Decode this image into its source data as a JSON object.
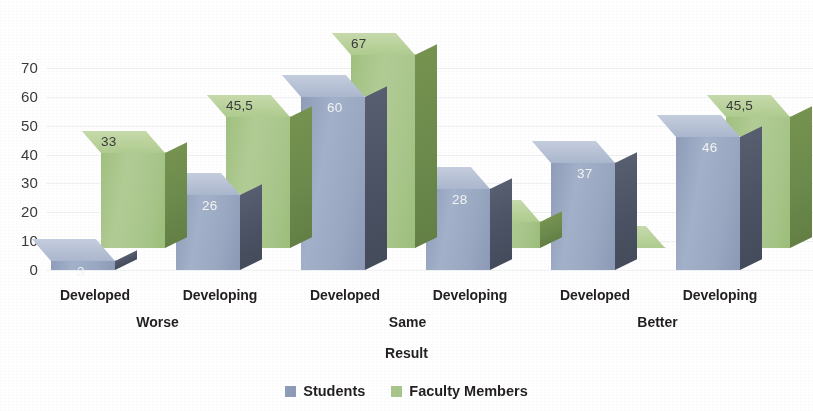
{
  "chart_data": {
    "type": "bar",
    "title": "",
    "subtitle": "",
    "xlabel": "Result",
    "ylabel": "",
    "ylim": [
      0,
      70
    ],
    "yticks": [
      0,
      10,
      20,
      30,
      40,
      50,
      60,
      70
    ],
    "ytick_labels": [
      "0",
      "10",
      "20",
      "30",
      "40",
      "50",
      "60",
      "70"
    ],
    "grid": true,
    "legend_position": "bottom",
    "categories": [
      "Developed",
      "Developing",
      "Developed",
      "Developing",
      "Developed",
      "Developing"
    ],
    "group_labels": [
      "Worse",
      "Same",
      "Better"
    ],
    "series": [
      {
        "name": "Students",
        "color": "#9aa9c4",
        "values": [
          3,
          26,
          60,
          28,
          37,
          46
        ],
        "value_labels": [
          "3",
          "26",
          "60",
          "28",
          "37",
          "46"
        ]
      },
      {
        "name": "Faculty Members",
        "color": "#a9c98a",
        "values": [
          33,
          45.5,
          67,
          9,
          0,
          45.5
        ],
        "value_labels": [
          "33",
          "45,5",
          "67",
          "9",
          "0",
          "45,5"
        ]
      }
    ]
  },
  "axis": {
    "y_ticks": [
      {
        "label": "70"
      },
      {
        "label": "60"
      },
      {
        "label": "50"
      },
      {
        "label": "40"
      },
      {
        "label": "30"
      },
      {
        "label": "20"
      },
      {
        "label": "10"
      },
      {
        "label": "0"
      }
    ],
    "x_ticks": [
      {
        "label": "Developed"
      },
      {
        "label": "Developing"
      },
      {
        "label": "Developed"
      },
      {
        "label": "Developing"
      },
      {
        "label": "Developed"
      },
      {
        "label": "Developing"
      }
    ],
    "x_groups": [
      {
        "label": "Worse"
      },
      {
        "label": "Same"
      },
      {
        "label": "Better"
      }
    ],
    "title": "Result"
  },
  "legend": {
    "items": [
      {
        "label": "Students",
        "color": "#8e9cb8"
      },
      {
        "label": "Faculty Members",
        "color": "#a8c68b"
      }
    ]
  },
  "bars": [
    {
      "label": "3",
      "series": "Students",
      "group": "Worse",
      "category": "Developed"
    },
    {
      "label": "33",
      "series": "Faculty Members",
      "group": "Worse",
      "category": "Developed"
    },
    {
      "label": "26",
      "series": "Students",
      "group": "Worse",
      "category": "Developing"
    },
    {
      "label": "45,5",
      "series": "Faculty Members",
      "group": "Worse",
      "category": "Developing"
    },
    {
      "label": "60",
      "series": "Students",
      "group": "Same",
      "category": "Developed"
    },
    {
      "label": "67",
      "series": "Faculty Members",
      "group": "Same",
      "category": "Developed"
    },
    {
      "label": "28",
      "series": "Students",
      "group": "Same",
      "category": "Developing"
    },
    {
      "label": "9",
      "series": "Faculty Members",
      "group": "Same",
      "category": "Developing"
    },
    {
      "label": "37",
      "series": "Students",
      "group": "Better",
      "category": "Developed"
    },
    {
      "label": "0",
      "series": "Faculty Members",
      "group": "Better",
      "category": "Developed"
    },
    {
      "label": "46",
      "series": "Students",
      "group": "Better",
      "category": "Developing"
    },
    {
      "label": "45,5",
      "series": "Faculty Members",
      "group": "Better",
      "category": "Developing"
    }
  ]
}
